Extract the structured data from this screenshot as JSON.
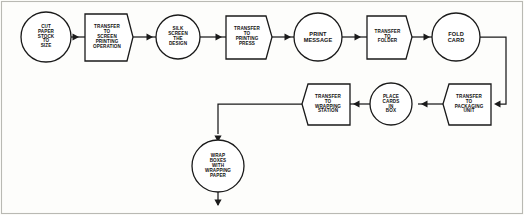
{
  "diagram": {
    "stroke_color": "#1a1a1a",
    "fill_color": "#ffffff",
    "background_color": "#fdfdfb",
    "frame_color": "#b9b9b3"
  },
  "nodes": {
    "cut_paper": {
      "label": "CUT\nPAPER\nSTOCK\nTO\nSIZE",
      "shape": "circle",
      "kind": "operation",
      "cx": 46,
      "cy": 37,
      "r": 25
    },
    "transfer_screen": {
      "label": "TRANSFER\nTO\nSCREEN\nPRINTING\nOPERATION",
      "shape": "chevron-box",
      "kind": "transfer",
      "x": 85,
      "y": 14,
      "w": 48,
      "h": 47
    },
    "silk_screen": {
      "label": "SILK\nSCREEN\nTHE\nDESIGN",
      "shape": "circle",
      "kind": "operation",
      "cx": 178,
      "cy": 37,
      "r": 22
    },
    "transfer_press": {
      "label": "TRANSFER\nTO\nPRINTING\nPRESS",
      "shape": "chevron-box",
      "kind": "transfer",
      "x": 226,
      "y": 16,
      "w": 46,
      "h": 43
    },
    "print_message": {
      "label": "PRINT\nMESSAGE",
      "shape": "circle",
      "kind": "operation",
      "cx": 318,
      "cy": 37,
      "r": 24
    },
    "transfer_folder": {
      "label": "TRANSFER\nTO\nFOLDER",
      "shape": "chevron-box",
      "kind": "transfer",
      "x": 367,
      "y": 16,
      "w": 45,
      "h": 43
    },
    "fold_card": {
      "label": "FOLD\nCARD",
      "shape": "circle",
      "kind": "operation",
      "cx": 456,
      "cy": 37,
      "r": 24
    },
    "transfer_packaging": {
      "label": "TRANSFER\nTO\nPACKAGING\nUNIT",
      "shape": "chevron-box",
      "kind": "transfer",
      "x": 443,
      "y": 84,
      "w": 48,
      "h": 41
    },
    "place_cards": {
      "label": "PLACE\nCARDS\nIN\nBOX",
      "shape": "circle",
      "kind": "operation",
      "cx": 391,
      "cy": 104,
      "r": 21
    },
    "transfer_wrapping": {
      "label": "TRANSFER\nTO\nWRAPPING\nSTATION",
      "shape": "chevron-box",
      "kind": "transfer",
      "x": 302,
      "y": 84,
      "w": 48,
      "h": 41
    },
    "wrap_boxes": {
      "label": "WRAP\nBOXES\nWITH\nWRAPPING\nPAPER",
      "shape": "circle",
      "kind": "operation",
      "cx": 218,
      "cy": 166,
      "r": 26
    }
  },
  "sequence": [
    "cut_paper",
    "transfer_screen",
    "silk_screen",
    "transfer_press",
    "print_message",
    "transfer_folder",
    "fold_card",
    "transfer_packaging",
    "place_cards",
    "transfer_wrapping",
    "wrap_boxes"
  ],
  "connectors": [
    {
      "name": "cut-to-transfer-screen",
      "from": "cut_paper",
      "to": "transfer_screen",
      "direction": "right"
    },
    {
      "name": "transfer-screen-to-silk",
      "from": "transfer_screen",
      "to": "silk_screen",
      "direction": "right"
    },
    {
      "name": "silk-to-transfer-press",
      "from": "silk_screen",
      "to": "transfer_press",
      "direction": "right"
    },
    {
      "name": "transfer-press-to-print",
      "from": "transfer_press",
      "to": "print_message",
      "direction": "right"
    },
    {
      "name": "print-to-transfer-folder",
      "from": "print_message",
      "to": "transfer_folder",
      "direction": "right"
    },
    {
      "name": "transfer-folder-to-fold",
      "from": "transfer_folder",
      "to": "fold_card",
      "direction": "right"
    },
    {
      "name": "fold-to-packaging",
      "from": "fold_card",
      "to": "transfer_packaging",
      "direction": "right-down-left"
    },
    {
      "name": "packaging-to-place-cards",
      "from": "transfer_packaging",
      "to": "place_cards",
      "direction": "left"
    },
    {
      "name": "place-cards-to-wrapping",
      "from": "place_cards",
      "to": "transfer_wrapping",
      "direction": "left"
    },
    {
      "name": "wrapping-to-wrap-boxes",
      "from": "transfer_wrapping",
      "to": "wrap_boxes",
      "direction": "left-down"
    },
    {
      "name": "wrap-boxes-exit",
      "from": "wrap_boxes",
      "to": null,
      "direction": "down"
    }
  ]
}
